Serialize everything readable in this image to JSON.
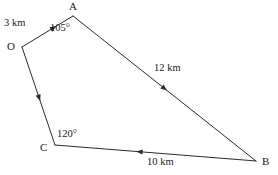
{
  "figure": {
    "background_color": "#ffffff",
    "stroke_color": "#2b2b2b",
    "text_color": "#1a1a1a"
  },
  "vertices": [
    {
      "id": "A",
      "label": "A",
      "x": 73,
      "y": 16,
      "label_x": 69,
      "label_y": 1
    },
    {
      "id": "O",
      "label": "O",
      "x": 22,
      "y": 47,
      "label_x": 7,
      "label_y": 41
    },
    {
      "id": "C",
      "label": "C",
      "x": 55,
      "y": 145,
      "label_x": 40,
      "label_y": 142
    },
    {
      "id": "B",
      "label": "B",
      "x": 256,
      "y": 161,
      "label_x": 262,
      "label_y": 156
    }
  ],
  "segments": [
    {
      "id": "OA",
      "from": "O",
      "to": "A",
      "length_label": "3 km",
      "label_x": 4,
      "label_y": 18,
      "arrow_at": 0.62,
      "arrow_direction": "toward-A"
    },
    {
      "id": "AB",
      "from": "A",
      "to": "B",
      "length_label": "12 km",
      "label_x": 154,
      "label_y": 63,
      "arrow_at": 0.5,
      "arrow_direction": "toward-B"
    },
    {
      "id": "CB",
      "from": "C",
      "to": "B",
      "length_label": "10 km",
      "label_x": 147,
      "label_y": 157,
      "arrow_at": 0.42,
      "arrow_direction": "toward-C"
    },
    {
      "id": "OC",
      "from": "O",
      "to": "C",
      "length_label": "",
      "label_x": 0,
      "label_y": 0,
      "arrow_at": 0.52,
      "arrow_direction": "toward-C"
    }
  ],
  "angles": [
    {
      "id": "angle-A",
      "at_vertex": "A",
      "label": "105°",
      "label_x": 50,
      "label_y": 23
    },
    {
      "id": "angle-C",
      "at_vertex": "C",
      "label": "120°",
      "label_x": 57,
      "label_y": 129
    }
  ]
}
